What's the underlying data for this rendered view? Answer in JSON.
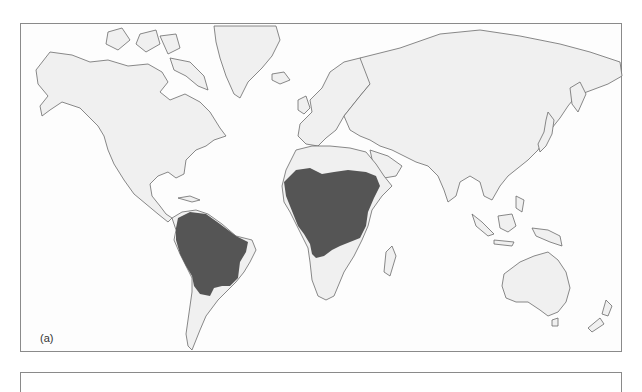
{
  "figure": {
    "panel_label": "(a)",
    "type": "world-distribution-map"
  },
  "map": {
    "projection": "equirectangular-like",
    "colors": {
      "ocean": "#fdfdfd",
      "land": "#f0f0f0",
      "coastline": "#6b6b6b",
      "highlight": "#555555",
      "frame": "#8a8a8a"
    },
    "highlighted_regions": [
      {
        "name": "Northern and central South America (Amazon basin, Brazil)"
      },
      {
        "name": "Sub-Saharan Central Africa (Sahel to Zambia/Angola)"
      }
    ],
    "continents_shown": [
      "North America",
      "Greenland",
      "South America",
      "Europe",
      "Africa",
      "Asia",
      "Australia",
      "New Zealand",
      "Madagascar",
      "Maritime Southeast Asia",
      "Japan"
    ]
  }
}
